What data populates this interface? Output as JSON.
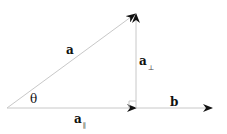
{
  "diagram": {
    "labels": {
      "a": "a",
      "theta": "θ",
      "a_parallel_base": "a",
      "a_parallel_sub": "∥",
      "a_perp_base": "a",
      "a_perp_sub": "⊥",
      "b": "b"
    },
    "points": {
      "origin": [
        7,
        108
      ],
      "foot": [
        136,
        108
      ],
      "a_tip": [
        136,
        13
      ],
      "b_tip": [
        212,
        108
      ]
    },
    "colors": {
      "line": "#c8c8c8",
      "arrowhead": "#111111",
      "text": "#111111"
    }
  }
}
